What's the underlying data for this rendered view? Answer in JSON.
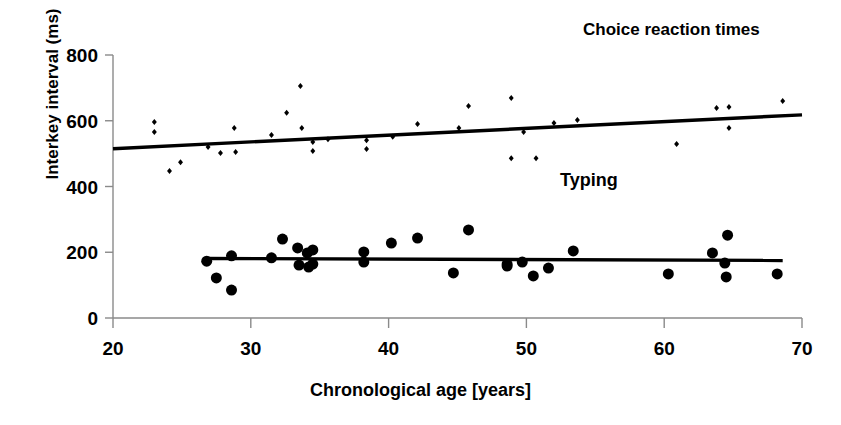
{
  "chart_data": {
    "type": "scatter",
    "title": "",
    "xlabel": "Chronological age [years]",
    "ylabel": "Interkey interval (ms)",
    "xlim": [
      20,
      70
    ],
    "ylim": [
      0,
      800
    ],
    "xticks": [
      20,
      30,
      40,
      50,
      60,
      70
    ],
    "yticks": [
      0,
      200,
      400,
      600,
      800
    ],
    "grid": false,
    "legend_position": "inline-annotations",
    "annotations": [
      {
        "text": "Choice reaction times",
        "x": 61.0,
        "y": 780
      },
      {
        "text": "Typing",
        "x": 52.5,
        "y": 330
      }
    ],
    "series": [
      {
        "name": "Choice reaction times",
        "marker": "diamond",
        "marker_size": 6,
        "color": "#000000",
        "points": [
          [
            23.0,
            596
          ],
          [
            23.0,
            566
          ],
          [
            24.1,
            447
          ],
          [
            24.9,
            474
          ],
          [
            26.9,
            520
          ],
          [
            27.8,
            502
          ],
          [
            28.8,
            578
          ],
          [
            28.9,
            505
          ],
          [
            31.5,
            557
          ],
          [
            32.6,
            624
          ],
          [
            33.6,
            706
          ],
          [
            33.7,
            578
          ],
          [
            34.5,
            535
          ],
          [
            34.5,
            508
          ],
          [
            35.6,
            544
          ],
          [
            38.4,
            541
          ],
          [
            38.4,
            514
          ],
          [
            40.3,
            551
          ],
          [
            42.1,
            590
          ],
          [
            45.1,
            578
          ],
          [
            45.8,
            645
          ],
          [
            48.9,
            669
          ],
          [
            48.9,
            486
          ],
          [
            49.8,
            566
          ],
          [
            50.7,
            486
          ],
          [
            52.0,
            593
          ],
          [
            53.7,
            602
          ],
          [
            60.9,
            529
          ],
          [
            63.8,
            639
          ],
          [
            64.7,
            642
          ],
          [
            64.7,
            578
          ],
          [
            68.6,
            660
          ]
        ],
        "trend": {
          "x0": 20.0,
          "y0": 515,
          "x1": 70.0,
          "y1": 618
        }
      },
      {
        "name": "Typing",
        "marker": "circle",
        "marker_size": 11,
        "color": "#000000",
        "points": [
          [
            26.8,
            173
          ],
          [
            27.5,
            122
          ],
          [
            28.6,
            189
          ],
          [
            28.6,
            85
          ],
          [
            31.5,
            183
          ],
          [
            32.3,
            240
          ],
          [
            33.4,
            213
          ],
          [
            33.5,
            161
          ],
          [
            34.1,
            198
          ],
          [
            34.2,
            155
          ],
          [
            34.5,
            207
          ],
          [
            34.5,
            164
          ],
          [
            38.2,
            201
          ],
          [
            38.2,
            170
          ],
          [
            40.2,
            228
          ],
          [
            42.1,
            243
          ],
          [
            44.7,
            137
          ],
          [
            45.8,
            268
          ],
          [
            48.6,
            164
          ],
          [
            48.6,
            158
          ],
          [
            49.7,
            170
          ],
          [
            50.5,
            128
          ],
          [
            51.6,
            152
          ],
          [
            53.4,
            204
          ],
          [
            60.3,
            134
          ],
          [
            63.5,
            198
          ],
          [
            64.4,
            167
          ],
          [
            64.5,
            125
          ],
          [
            64.6,
            252
          ],
          [
            68.2,
            134
          ]
        ],
        "trend": {
          "x0": 26.8,
          "y0": 181,
          "x1": 68.6,
          "y1": 175
        }
      }
    ]
  },
  "axes": {
    "x_tick_labels": [
      "20",
      "30",
      "40",
      "50",
      "60",
      "70"
    ],
    "y_tick_labels": [
      "0",
      "200",
      "400",
      "600",
      "800"
    ],
    "x_axis_title": "Chronological age [years]",
    "y_axis_title": "Interkey interval (ms)"
  },
  "labels": {
    "choice": "Choice reaction times",
    "typing": "Typing"
  }
}
